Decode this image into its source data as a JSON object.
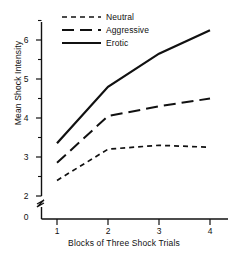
{
  "chart_data": {
    "type": "line",
    "title": "",
    "xlabel": "Blocks of Three Shock Trials",
    "ylabel": "Mean Shock Intensity",
    "categories": [
      "1",
      "2",
      "3",
      "4"
    ],
    "x": [
      1,
      2,
      3,
      4
    ],
    "xlim": [
      1,
      4
    ],
    "ylim": [
      2,
      6.5
    ],
    "y_axis_break": true,
    "y_axis_origin_label": "0",
    "yticks_labeled": [
      "6",
      "5",
      "4",
      "3",
      "2"
    ],
    "yticks_values": [
      6,
      5,
      4,
      3,
      2
    ],
    "yticks_minor_values": [
      6.5,
      5.5,
      4.5,
      3.5,
      2.5
    ],
    "xticks": [
      "1",
      "2",
      "3",
      "4"
    ],
    "grid": false,
    "legend_position": "top-left",
    "series": [
      {
        "name": "Neutral",
        "style": "short-dash",
        "values": [
          2.4,
          3.2,
          3.3,
          3.25
        ]
      },
      {
        "name": "Aggressive",
        "style": "long-dash",
        "values": [
          2.85,
          4.05,
          4.3,
          4.5
        ]
      },
      {
        "name": "Erotic",
        "style": "solid",
        "values": [
          3.35,
          4.8,
          5.65,
          6.25
        ]
      }
    ],
    "line_color": "#111111"
  },
  "axes": {
    "y_title": "Mean Shock Intensity",
    "x_title": "Blocks of Three Shock Trials",
    "y_tick_6": "6",
    "y_tick_5": "5",
    "y_tick_4": "4",
    "y_tick_3": "3",
    "y_tick_2": "2",
    "y_tick_0": "0",
    "x_tick_1": "1",
    "x_tick_2": "2",
    "x_tick_3": "3",
    "x_tick_4": "4"
  },
  "legend": {
    "items": [
      {
        "label": "Neutral"
      },
      {
        "label": "Aggressive"
      },
      {
        "label": "Erotic"
      }
    ]
  }
}
